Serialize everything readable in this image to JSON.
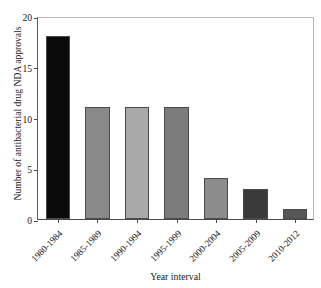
{
  "chart_data": {
    "type": "bar",
    "title": "",
    "xlabel": "Year interval",
    "ylabel": "Number of antibacterial drug NDA approvals",
    "categories": [
      "1980-1984",
      "1985-1989",
      "1990-1994",
      "1995-1999",
      "2000-2004",
      "2005-2009",
      "2010-2012"
    ],
    "values": [
      18,
      11,
      11,
      11,
      4,
      3,
      1
    ],
    "bar_colors": [
      "#0b0b0b",
      "#8a8a8a",
      "#a9a9a9",
      "#7c7c7c",
      "#8c8c8c",
      "#3a3a3a",
      "#565656"
    ],
    "ylim": [
      0,
      20
    ],
    "yticks": [
      0,
      5,
      10,
      15,
      20
    ],
    "ytick_labels": [
      "0",
      "5",
      "10",
      "15",
      "20"
    ],
    "grid": false,
    "legend": "none",
    "frame": "box"
  },
  "axes": {
    "y_title": "Number of antibacterial drug NDA approvals",
    "x_title": "Year interval"
  }
}
